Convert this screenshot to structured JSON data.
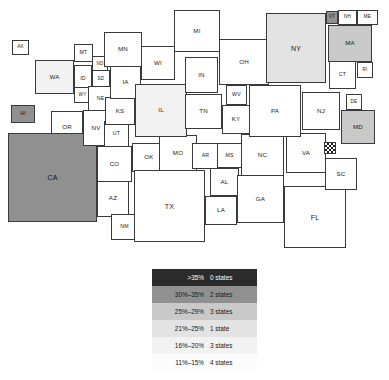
{
  "chart_data": {
    "type": "map",
    "subtype": "cartogram-choropleth",
    "title": "",
    "region": "United States",
    "legend": {
      "position": "bottom-center",
      "rows": [
        {
          "range": ">35%",
          "count": "0 states",
          "shade": "#2b2b2b",
          "band": "b6"
        },
        {
          "range": "30%–35%",
          "count": "2 states",
          "shade": "#909090",
          "band": "b5"
        },
        {
          "range": "25%–29%",
          "count": "3 states",
          "shade": "#c9c9c9",
          "band": "b4"
        },
        {
          "range": "21%–25%",
          "count": "1 state",
          "shade": "#e3e3e3",
          "band": "b3"
        },
        {
          "range": "16%–20%",
          "count": "3 states",
          "shade": "#f2f2f2",
          "band": "b2"
        },
        {
          "range": "11%–15%",
          "count": "4 states",
          "shade": "#fcfcfc",
          "band": "b1"
        }
      ]
    },
    "no_data_pattern": "checkerboard",
    "states": [
      {
        "code": "AK",
        "band": "none",
        "x": 12,
        "y": 40,
        "w": 17,
        "h": 15
      },
      {
        "code": "HI",
        "band": "b5",
        "x": 11,
        "y": 105,
        "w": 24,
        "h": 18
      },
      {
        "code": "WA",
        "band": "b2",
        "x": 35,
        "y": 60,
        "w": 39,
        "h": 34
      },
      {
        "code": "OR",
        "band": "none",
        "x": 51,
        "y": 111,
        "w": 32,
        "h": 33
      },
      {
        "code": "CA",
        "band": "b5",
        "x": 8,
        "y": 133,
        "w": 89,
        "h": 89
      },
      {
        "code": "NV",
        "band": "none",
        "x": 83,
        "y": 110,
        "w": 26,
        "h": 36
      },
      {
        "code": "ID",
        "band": "none",
        "x": 74,
        "y": 65,
        "w": 18,
        "h": 27
      },
      {
        "code": "MT",
        "band": "none",
        "x": 74,
        "y": 44,
        "w": 19,
        "h": 18
      },
      {
        "code": "WY",
        "band": "none",
        "x": 74,
        "y": 87,
        "w": 17,
        "h": 16
      },
      {
        "code": "UT",
        "band": "none",
        "x": 104,
        "y": 121,
        "w": 25,
        "h": 26
      },
      {
        "code": "AZ",
        "band": "none",
        "x": 97,
        "y": 180,
        "w": 32,
        "h": 37
      },
      {
        "code": "NM",
        "band": "none",
        "x": 111,
        "y": 214,
        "w": 27,
        "h": 26
      },
      {
        "code": "CO",
        "band": "none",
        "x": 97,
        "y": 146,
        "w": 35,
        "h": 36
      },
      {
        "code": "ND",
        "band": "none",
        "x": 92,
        "y": 56,
        "w": 16,
        "h": 16
      },
      {
        "code": "SD",
        "band": "none",
        "x": 92,
        "y": 70,
        "w": 18,
        "h": 18
      },
      {
        "code": "NE",
        "band": "none",
        "x": 88,
        "y": 86,
        "w": 25,
        "h": 25
      },
      {
        "code": "KS",
        "band": "none",
        "x": 105,
        "y": 97,
        "w": 30,
        "h": 28
      },
      {
        "code": "OK",
        "band": "none",
        "x": 132,
        "y": 143,
        "w": 34,
        "h": 29
      },
      {
        "code": "TX",
        "band": "none",
        "x": 134,
        "y": 170,
        "w": 71,
        "h": 72
      },
      {
        "code": "MN",
        "band": "none",
        "x": 104,
        "y": 32,
        "w": 38,
        "h": 35
      },
      {
        "code": "IA",
        "band": "none",
        "x": 110,
        "y": 66,
        "w": 31,
        "h": 33
      },
      {
        "code": "MO",
        "band": "none",
        "x": 159,
        "y": 135,
        "w": 38,
        "h": 36
      },
      {
        "code": "WI",
        "band": "none",
        "x": 141,
        "y": 46,
        "w": 34,
        "h": 34
      },
      {
        "code": "IL",
        "band": "b2",
        "x": 135,
        "y": 84,
        "w": 52,
        "h": 53
      },
      {
        "code": "MI",
        "band": "none",
        "x": 174,
        "y": 10,
        "w": 46,
        "h": 42
      },
      {
        "code": "IN",
        "band": "none",
        "x": 185,
        "y": 57,
        "w": 33,
        "h": 36
      },
      {
        "code": "OH",
        "band": "none",
        "x": 219,
        "y": 39,
        "w": 50,
        "h": 46
      },
      {
        "code": "TN",
        "band": "none",
        "x": 185,
        "y": 94,
        "w": 37,
        "h": 35
      },
      {
        "code": "KY",
        "band": "none",
        "x": 222,
        "y": 105,
        "w": 28,
        "h": 29
      },
      {
        "code": "WV",
        "band": "none",
        "x": 226,
        "y": 85,
        "w": 21,
        "h": 20
      },
      {
        "code": "AR",
        "band": "none",
        "x": 192,
        "y": 143,
        "w": 27,
        "h": 26
      },
      {
        "code": "MS",
        "band": "none",
        "x": 217,
        "y": 143,
        "w": 25,
        "h": 25
      },
      {
        "code": "AL",
        "band": "none",
        "x": 210,
        "y": 168,
        "w": 29,
        "h": 28
      },
      {
        "code": "LA",
        "band": "none",
        "x": 205,
        "y": 196,
        "w": 32,
        "h": 29
      },
      {
        "code": "GA",
        "band": "none",
        "x": 237,
        "y": 175,
        "w": 47,
        "h": 48
      },
      {
        "code": "FL",
        "band": "none",
        "x": 284,
        "y": 186,
        "w": 62,
        "h": 62
      },
      {
        "code": "SC",
        "band": "none",
        "x": 325,
        "y": 158,
        "w": 32,
        "h": 32
      },
      {
        "code": "NC",
        "band": "none",
        "x": 241,
        "y": 134,
        "w": 43,
        "h": 42
      },
      {
        "code": "VA",
        "band": "none",
        "x": 286,
        "y": 133,
        "w": 40,
        "h": 40
      },
      {
        "code": "DC",
        "band": "nodata",
        "x": 324,
        "y": 142,
        "w": 12,
        "h": 12
      },
      {
        "code": "MD",
        "band": "b4",
        "x": 341,
        "y": 110,
        "w": 34,
        "h": 34
      },
      {
        "code": "DE",
        "band": "none",
        "x": 346,
        "y": 94,
        "w": 16,
        "h": 16
      },
      {
        "code": "NJ",
        "band": "none",
        "x": 302,
        "y": 92,
        "w": 38,
        "h": 38
      },
      {
        "code": "PA",
        "band": "none",
        "x": 249,
        "y": 85,
        "w": 52,
        "h": 52
      },
      {
        "code": "NY",
        "band": "b3",
        "x": 266,
        "y": 13,
        "w": 60,
        "h": 70
      },
      {
        "code": "CT",
        "band": "none",
        "x": 329,
        "y": 61,
        "w": 27,
        "h": 28
      },
      {
        "code": "RI",
        "band": "none",
        "x": 357,
        "y": 62,
        "w": 16,
        "h": 16
      },
      {
        "code": "MA",
        "band": "b4",
        "x": 328,
        "y": 25,
        "w": 44,
        "h": 37
      },
      {
        "code": "VT",
        "band": "b5",
        "x": 326,
        "y": 11,
        "w": 12,
        "h": 13
      },
      {
        "code": "NH",
        "band": "none",
        "x": 338,
        "y": 10,
        "w": 19,
        "h": 15
      },
      {
        "code": "ME",
        "band": "none",
        "x": 357,
        "y": 10,
        "w": 21,
        "h": 15
      }
    ]
  }
}
